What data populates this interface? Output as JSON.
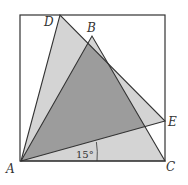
{
  "figure": {
    "type": "geometry",
    "square": {
      "vertices": "20,15 165,15 165,161 20,161"
    },
    "triangles": [
      {
        "name": "ADE",
        "points": "21,161 60,15 165,121",
        "fill": "#cfcfcf"
      },
      {
        "name": "ABC",
        "points": "21,161 92,36 165,161",
        "fill": "#cfcfcf"
      }
    ],
    "overlap_fill": "#9a9a9a",
    "labels": {
      "A": "A",
      "B": "B",
      "C": "C",
      "D": "D",
      "E": "E"
    },
    "angle_label": "15°"
  }
}
